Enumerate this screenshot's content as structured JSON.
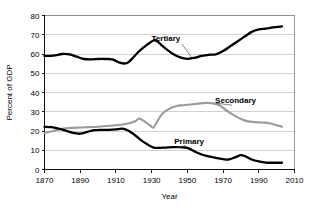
{
  "chart_data": {
    "type": "line",
    "title": "",
    "xlabel": "Year",
    "ylabel": "Percent of GDP",
    "xlim": [
      1870,
      2010
    ],
    "ylim": [
      0,
      80
    ],
    "grid": true,
    "legend": "inline-annotations",
    "xticks": [
      "1870",
      "1890",
      "1910",
      "1930",
      "1950",
      "1970",
      "1990",
      "2010"
    ],
    "xtick_values": [
      1870,
      1890,
      1910,
      1930,
      1950,
      1970,
      1990,
      2010
    ],
    "yticks": [
      "0",
      "10",
      "20",
      "30",
      "40",
      "50",
      "60",
      "70",
      "80"
    ],
    "ytick_values": [
      0,
      10,
      20,
      30,
      40,
      50,
      60,
      70,
      80
    ],
    "series": [
      {
        "name": "Tertiary",
        "color": "#000000",
        "width": 2.3,
        "label_x": 1938,
        "label_y": 66.5,
        "leader_from_x": 1947,
        "leader_from_y": 65.2,
        "leader_to_x": 1952,
        "leader_to_y": 58.6,
        "x": [
          1870,
          1875,
          1880,
          1884,
          1888,
          1892,
          1896,
          1900,
          1904,
          1908,
          1912,
          1916,
          1919,
          1922,
          1925,
          1928,
          1931,
          1933,
          1936,
          1939,
          1942,
          1946,
          1950,
          1954,
          1958,
          1962,
          1966,
          1970,
          1974,
          1978,
          1982,
          1986,
          1990,
          1994,
          1998,
          2003
        ],
        "y": [
          59.0,
          59.2,
          60.0,
          59.8,
          58.6,
          57.4,
          57.2,
          57.4,
          57.4,
          57.2,
          55.5,
          55.2,
          57.5,
          60.5,
          63.0,
          65.2,
          67.0,
          66.8,
          64.2,
          62.0,
          60.0,
          58.2,
          57.5,
          58.0,
          59.0,
          59.6,
          59.8,
          61.5,
          64.0,
          66.5,
          69.0,
          71.5,
          72.8,
          73.2,
          73.8,
          74.3
        ]
      },
      {
        "name": "Secondary",
        "color": "#9a9a9a",
        "width": 2.1,
        "label_x": 1977,
        "label_y": 34.5,
        "leader_from_x": 1975,
        "leader_from_y": 33.4,
        "leader_to_x": 1966,
        "leader_to_y": 34.5,
        "x": [
          1870,
          1875,
          1880,
          1885,
          1890,
          1895,
          1900,
          1905,
          1910,
          1914,
          1918,
          1921,
          1923,
          1926,
          1929,
          1931,
          1933,
          1936,
          1940,
          1944,
          1948,
          1952,
          1956,
          1960,
          1964,
          1968,
          1972,
          1976,
          1980,
          1984,
          1988,
          1992,
          1996,
          2000,
          2003
        ],
        "y": [
          19.0,
          20.0,
          21.2,
          21.6,
          21.8,
          22.0,
          22.2,
          22.6,
          23.0,
          23.4,
          24.2,
          25.2,
          26.5,
          25.0,
          23.0,
          21.8,
          24.8,
          29.0,
          31.6,
          33.0,
          33.4,
          33.8,
          34.2,
          34.6,
          34.4,
          33.4,
          30.6,
          28.2,
          26.2,
          25.0,
          24.6,
          24.4,
          24.0,
          23.0,
          22.2
        ]
      },
      {
        "name": "Primary",
        "color": "#000000",
        "width": 2.3,
        "label_x": 1951,
        "label_y": 13.5,
        "leader_from_x": 1949,
        "leader_from_y": 12.4,
        "leader_to_x": 1944,
        "leader_to_y": 11.4,
        "x": [
          1870,
          1874,
          1878,
          1882,
          1886,
          1890,
          1894,
          1898,
          1902,
          1906,
          1910,
          1913,
          1916,
          1919,
          1922,
          1925,
          1928,
          1931,
          1934,
          1938,
          1942,
          1946,
          1950,
          1954,
          1958,
          1962,
          1966,
          1970,
          1973,
          1977,
          1980,
          1983,
          1986,
          1990,
          1994,
          1998,
          2003
        ],
        "y": [
          22.2,
          22.0,
          21.2,
          20.2,
          19.0,
          18.6,
          19.6,
          20.4,
          20.6,
          20.6,
          20.8,
          21.2,
          20.6,
          19.0,
          16.8,
          14.6,
          12.8,
          11.4,
          11.2,
          11.4,
          11.6,
          11.6,
          11.2,
          9.4,
          7.8,
          6.8,
          6.0,
          5.4,
          5.2,
          6.4,
          7.5,
          6.6,
          5.2,
          4.2,
          3.6,
          3.5,
          3.5
        ]
      }
    ]
  },
  "axes": {
    "ylabel_text": "Percent of GDP",
    "xlabel_text": "Year"
  }
}
